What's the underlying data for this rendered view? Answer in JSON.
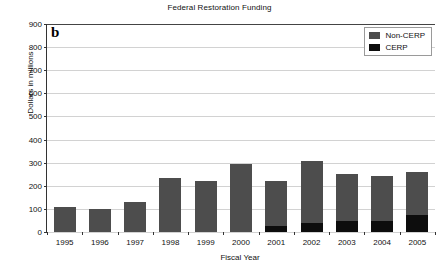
{
  "chart_data": {
    "type": "bar",
    "title": "Federal Restoration Funding",
    "panel_label": "b",
    "xlabel": "Fiscal Year",
    "ylabel": "Dollars in millions",
    "categories": [
      "1995",
      "1996",
      "1997",
      "1998",
      "1999",
      "2000",
      "2001",
      "2002",
      "2003",
      "2004",
      "2005"
    ],
    "series": [
      {
        "name": "CERP",
        "color": "#0d0d0d",
        "values": [
          0,
          0,
          0,
          0,
          0,
          0,
          27,
          39,
          47,
          48,
          74
        ]
      },
      {
        "name": "Non-CERP",
        "color": "#4d4d4d",
        "values": [
          110,
          100,
          128,
          232,
          222,
          294,
          195,
          269,
          202,
          195,
          186
        ]
      }
    ],
    "totals": [
      110,
      100,
      128,
      232,
      222,
      294,
      222,
      308,
      249,
      243,
      260
    ],
    "stacked": true,
    "ylim": [
      0,
      900
    ],
    "yticks": [
      0,
      100,
      200,
      300,
      400,
      500,
      600,
      700,
      800,
      900
    ],
    "ytick_labels": [
      "0",
      "100",
      "200",
      "300",
      "400",
      "500",
      "600",
      "700",
      "800",
      "900"
    ],
    "grid": "horizontal",
    "legend_position": "top-right",
    "legend_entries": [
      "Non-CERP",
      "CERP"
    ]
  }
}
